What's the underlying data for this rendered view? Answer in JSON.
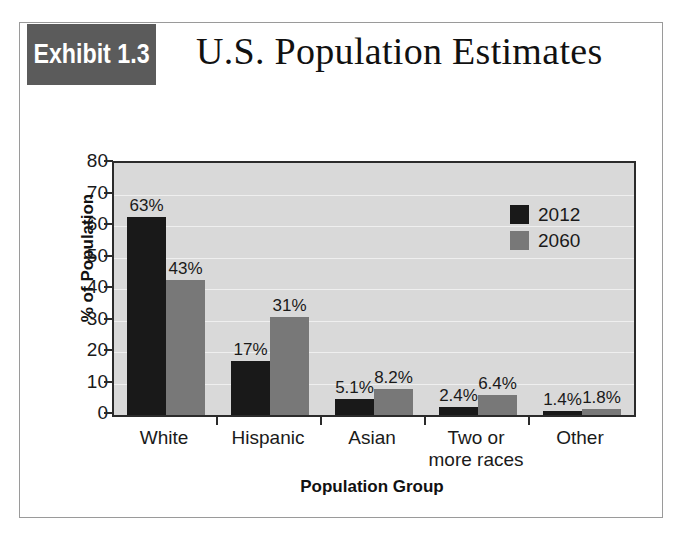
{
  "exhibit": {
    "badge_label": "Exhibit 1.3",
    "title": "U.S. Population Estimates",
    "badge_color": "#5b5b5b",
    "frame_border_color": "#9a9a9a"
  },
  "chart_data": {
    "type": "bar",
    "title": "U.S. Population Estimates",
    "categories": [
      "White",
      "Hispanic",
      "Asian",
      "Two or\nmore races",
      "Other"
    ],
    "category_labels": [
      {
        "line1": "White",
        "line2": ""
      },
      {
        "line1": "Hispanic",
        "line2": ""
      },
      {
        "line1": "Asian",
        "line2": ""
      },
      {
        "line1": "Two or",
        "line2": "more races"
      },
      {
        "line1": "Other",
        "line2": ""
      }
    ],
    "series": [
      {
        "name": "2012",
        "color": "#191919",
        "values": [
          63,
          17,
          5.1,
          2.4,
          1.4
        ],
        "labels": [
          "63%",
          "17%",
          "5.1%",
          "2.4%",
          "1.4%"
        ]
      },
      {
        "name": "2060",
        "color": "#787878",
        "values": [
          43,
          31,
          8.2,
          6.4,
          1.8
        ],
        "labels": [
          "43%",
          "31%",
          "8.2%",
          "6.4%",
          "1.8%"
        ]
      }
    ],
    "xlabel": "Population Group",
    "ylabel": "% of Population",
    "ylim": [
      0,
      80
    ],
    "ytick_step": 10,
    "yticks": [
      80,
      70,
      60,
      50,
      40,
      30,
      20,
      10,
      0
    ],
    "ytick_labels": [
      "80",
      "70",
      "60",
      "50",
      "40",
      "30",
      "20",
      "10",
      "0"
    ],
    "grid": true,
    "grid_color": "#efefef",
    "plot_background": "#d9d9d9",
    "legend_position": "top-right",
    "legend_entries": [
      "2012",
      "2060"
    ]
  }
}
